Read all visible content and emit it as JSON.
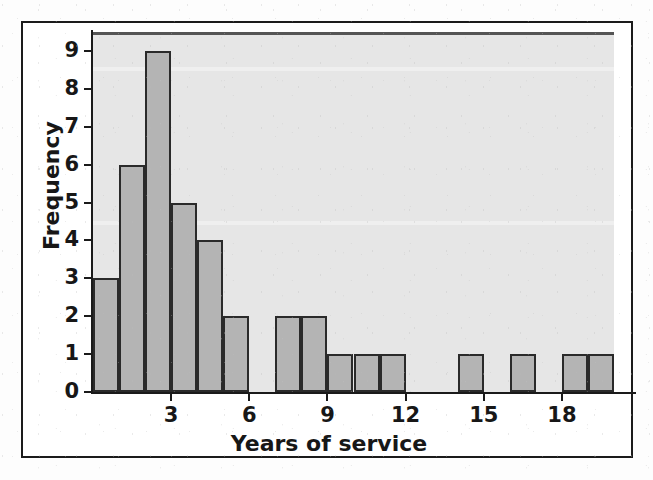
{
  "figure": {
    "frame_color": "#1b1b1b",
    "plot_background": "#e6e6e6",
    "bar_fill": "#b4b4b4",
    "bar_stroke": "#2a2a2a",
    "axis_color": "#1a1a1a"
  },
  "chart_data": {
    "type": "bar",
    "title": "",
    "xlabel": "Years of service",
    "ylabel": "Frequency",
    "grid": false,
    "legend": null,
    "xlim": [
      0,
      20
    ],
    "ylim": [
      0,
      9.5
    ],
    "bin_width": 1,
    "x_tick_labels": [
      "3",
      "6",
      "9",
      "12",
      "15",
      "18"
    ],
    "x_tick_values": [
      3,
      6,
      9,
      12,
      15,
      18
    ],
    "y_tick_labels": [
      "0",
      "1",
      "2",
      "3",
      "4",
      "5",
      "6",
      "7",
      "8",
      "9"
    ],
    "y_tick_values": [
      0,
      1,
      2,
      3,
      4,
      5,
      6,
      7,
      8,
      9
    ],
    "bins": [
      {
        "start": 0,
        "end": 1,
        "value": 3
      },
      {
        "start": 1,
        "end": 2,
        "value": 6
      },
      {
        "start": 2,
        "end": 3,
        "value": 9
      },
      {
        "start": 3,
        "end": 4,
        "value": 5
      },
      {
        "start": 4,
        "end": 5,
        "value": 4
      },
      {
        "start": 5,
        "end": 6,
        "value": 2
      },
      {
        "start": 6,
        "end": 7,
        "value": 0
      },
      {
        "start": 7,
        "end": 8,
        "value": 2
      },
      {
        "start": 8,
        "end": 9,
        "value": 2
      },
      {
        "start": 9,
        "end": 10,
        "value": 1
      },
      {
        "start": 10,
        "end": 11,
        "value": 1
      },
      {
        "start": 11,
        "end": 12,
        "value": 1
      },
      {
        "start": 12,
        "end": 13,
        "value": 0
      },
      {
        "start": 13,
        "end": 14,
        "value": 0
      },
      {
        "start": 14,
        "end": 15,
        "value": 1
      },
      {
        "start": 15,
        "end": 16,
        "value": 0
      },
      {
        "start": 16,
        "end": 17,
        "value": 1
      },
      {
        "start": 17,
        "end": 18,
        "value": 0
      },
      {
        "start": 18,
        "end": 19,
        "value": 1
      },
      {
        "start": 19,
        "end": 20,
        "value": 1
      }
    ],
    "categories": [
      "0-1",
      "1-2",
      "2-3",
      "3-4",
      "4-5",
      "5-6",
      "6-7",
      "7-8",
      "8-9",
      "9-10",
      "10-11",
      "11-12",
      "12-13",
      "13-14",
      "14-15",
      "15-16",
      "16-17",
      "17-18",
      "18-19",
      "19-20"
    ],
    "values": [
      3,
      6,
      9,
      5,
      4,
      2,
      0,
      2,
      2,
      1,
      1,
      1,
      0,
      0,
      1,
      0,
      1,
      0,
      1,
      1
    ]
  }
}
